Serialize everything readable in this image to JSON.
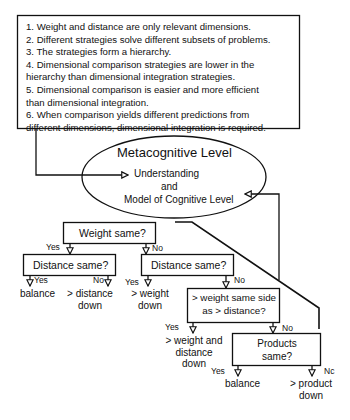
{
  "principles_box": {
    "lines": [
      "1. Weight and distance are only relevant dimensions.",
      "2. Different strategies solve different subsets of problems.",
      "3. The strategies form a hierarchy.",
      "4. Dimensional comparison strategies are lower in the",
      "hierarchy than dimensional integration strategies.",
      "5. Dimensional comparison is easier and more efficient",
      "than dimensional integration.",
      "6. When  comparison yields different predictions from",
      "different dimensions, dimensional integration is required."
    ]
  },
  "metacognitive": {
    "title": "Metacognitive Level",
    "line1": "Understanding",
    "line2": "and",
    "line3": "Model of Cognitive Level"
  },
  "tree": {
    "weight_same": {
      "label": "Weight same?",
      "yes": "Yes",
      "no": "No"
    },
    "distance_same_left": {
      "label": "Distance same?",
      "yes": "Yes",
      "no": "No",
      "yes_outcome": "balance",
      "no_outcome": [
        "> distance",
        "down"
      ]
    },
    "distance_same_right": {
      "label": "Distance same?",
      "yes": "Yes",
      "no": "No",
      "yes_outcome": [
        "> weight",
        "down"
      ]
    },
    "weight_same_side": {
      "label": [
        "> weight same side",
        "as > distance?"
      ],
      "yes": "Yes",
      "no": "No",
      "yes_outcome": [
        "> weight and",
        "distance",
        "down"
      ]
    },
    "products_same": {
      "label": [
        "Products",
        "same?"
      ],
      "yes": "Yes",
      "no": "Nc",
      "yes_outcome": "balance",
      "no_outcome": [
        "> product",
        "down"
      ]
    }
  }
}
